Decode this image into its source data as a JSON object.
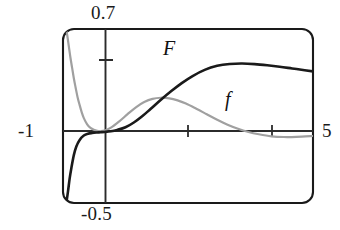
{
  "figure": {
    "kind": "function-plot",
    "frame": {
      "rounded": true,
      "stroke": "#1a1a1a"
    }
  },
  "labels": {
    "top": "0.7",
    "left": "-1",
    "right": "5",
    "bottom": "-0.5",
    "curve_F": "F",
    "curve_f": "f"
  },
  "colors": {
    "curve_F": "#1a1a1a",
    "curve_f": "#a0a0a0",
    "axis": "#2b2b2b",
    "frame": "#1a1a1a",
    "text": "#111111"
  },
  "chart_data": {
    "type": "line",
    "title": "",
    "xlabel": "",
    "ylabel": "",
    "xlim": [
      -1,
      5
    ],
    "ylim": [
      -0.5,
      0.7
    ],
    "grid": false,
    "legend": "inline-curve-labels",
    "x_ticks": [
      -1,
      1,
      3,
      5
    ],
    "x_tick_labels": [
      "-1",
      "",
      "",
      "5"
    ],
    "y_ticks": [
      -0.5,
      0.35,
      0.7
    ],
    "y_tick_labels": [
      "-0.5",
      "",
      "0.7"
    ],
    "axis_origin": {
      "x": 0,
      "y": 0
    },
    "series": [
      {
        "name": "F",
        "color": "#1a1a1a",
        "width": 2.6,
        "x": [
          -0.92,
          -0.88,
          -0.84,
          -0.8,
          -0.74,
          -0.68,
          -0.6,
          -0.5,
          -0.4,
          -0.3,
          -0.2,
          -0.1,
          0.0,
          0.15,
          0.3,
          0.5,
          0.7,
          0.9,
          1.1,
          1.35,
          1.6,
          1.85,
          2.1,
          2.4,
          2.7,
          3.0,
          3.3,
          3.6,
          3.9,
          4.2,
          4.5,
          4.8,
          5.0
        ],
        "y": [
          -0.5,
          -0.42,
          -0.33,
          -0.26,
          -0.17,
          -0.11,
          -0.065,
          -0.035,
          -0.022,
          -0.017,
          -0.014,
          -0.012,
          -0.01,
          -0.005,
          0.004,
          0.022,
          0.055,
          0.098,
          0.148,
          0.212,
          0.272,
          0.327,
          0.374,
          0.418,
          0.446,
          0.459,
          0.462,
          0.458,
          0.45,
          0.44,
          0.428,
          0.416,
          0.408
        ]
      },
      {
        "name": "f",
        "color": "#a0a0a0",
        "width": 2.2,
        "x": [
          -0.93,
          -0.9,
          -0.86,
          -0.82,
          -0.78,
          -0.74,
          -0.7,
          -0.65,
          -0.6,
          -0.55,
          -0.5,
          -0.42,
          -0.34,
          -0.26,
          -0.18,
          -0.1,
          0.0,
          0.15,
          0.35,
          0.55,
          0.75,
          0.95,
          1.15,
          1.35,
          1.55,
          1.75,
          1.95,
          2.2,
          2.45,
          2.7,
          2.95,
          3.2,
          3.45,
          3.7,
          4.0,
          4.3,
          4.6,
          5.0
        ],
        "y": [
          0.7,
          0.66,
          0.58,
          0.5,
          0.43,
          0.36,
          0.3,
          0.23,
          0.175,
          0.125,
          0.085,
          0.042,
          0.018,
          0.005,
          -0.002,
          -0.004,
          0.0,
          0.02,
          0.063,
          0.113,
          0.16,
          0.196,
          0.218,
          0.226,
          0.222,
          0.208,
          0.186,
          0.15,
          0.112,
          0.074,
          0.04,
          0.012,
          -0.01,
          -0.026,
          -0.04,
          -0.045,
          -0.044,
          -0.038
        ]
      }
    ],
    "annotations": [
      {
        "text": "F",
        "x": 1.25,
        "y": 0.5
      },
      {
        "text": "f",
        "x": 2.85,
        "y": 0.26
      }
    ]
  }
}
